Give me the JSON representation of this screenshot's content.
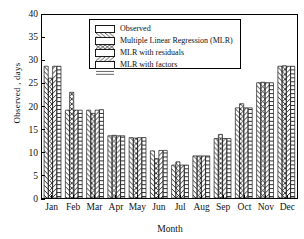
{
  "chart_data": {
    "type": "bar",
    "title": "",
    "xlabel": "Month",
    "ylabel": "Observed , days",
    "ylim": [
      0,
      40
    ],
    "yticks": [
      0,
      5,
      10,
      15,
      20,
      25,
      30,
      35,
      40
    ],
    "grid": false,
    "legend_position": "top-center-inside",
    "categories": [
      "Jan",
      "Feb",
      "Mar",
      "Apr",
      "May",
      "Jun",
      "Jul",
      "Aug",
      "Sep",
      "Oct",
      "Nov",
      "Dec"
    ],
    "series": [
      {
        "name": "Observed",
        "pattern": "diagonal-backslash",
        "values": [
          28.8,
          19.2,
          19.2,
          13.6,
          13.2,
          10.3,
          7.2,
          9.2,
          13.0,
          19.7,
          25.2,
          28.8
        ]
      },
      {
        "name": "Multiple Linear Regression (MLR)",
        "pattern": "crosshatch-diamond",
        "values": [
          26.2,
          23.1,
          18.5,
          13.7,
          13.1,
          8.6,
          7.9,
          9.2,
          13.9,
          20.6,
          25.3,
          28.9
        ]
      },
      {
        "name": "MLR with residuals",
        "pattern": "diagonal-slash",
        "values": [
          28.8,
          19.2,
          19.2,
          13.6,
          13.2,
          10.4,
          7.2,
          9.2,
          13.0,
          19.7,
          25.2,
          28.8
        ]
      },
      {
        "name": "MLR with factors",
        "pattern": "horizontal-lines",
        "values": [
          28.8,
          19.2,
          19.3,
          13.6,
          13.2,
          10.4,
          7.2,
          9.2,
          13.0,
          19.7,
          25.2,
          28.8
        ]
      }
    ]
  },
  "legend": {
    "items": [
      {
        "label": "Observed"
      },
      {
        "label": "Multiple Linear Regression (MLR)"
      },
      {
        "label": "MLR with residuals"
      },
      {
        "label": "MLR with factors"
      }
    ]
  },
  "axes": {
    "y_title": "Observed , days",
    "x_title": "Month",
    "y_tick_labels": [
      "0",
      "5",
      "10",
      "15",
      "20",
      "25",
      "30",
      "35",
      "40"
    ],
    "x_tick_labels": [
      "Jan",
      "Feb",
      "Mar",
      "Apr",
      "May",
      "Jun",
      "Jul",
      "Aug",
      "Sep",
      "Oct",
      "Nov",
      "Dec"
    ]
  },
  "colors": {
    "axis": "#000000",
    "bar_edge": "#1a1a1a",
    "bar_fill": "#ffffff",
    "background": "#ffffff"
  }
}
